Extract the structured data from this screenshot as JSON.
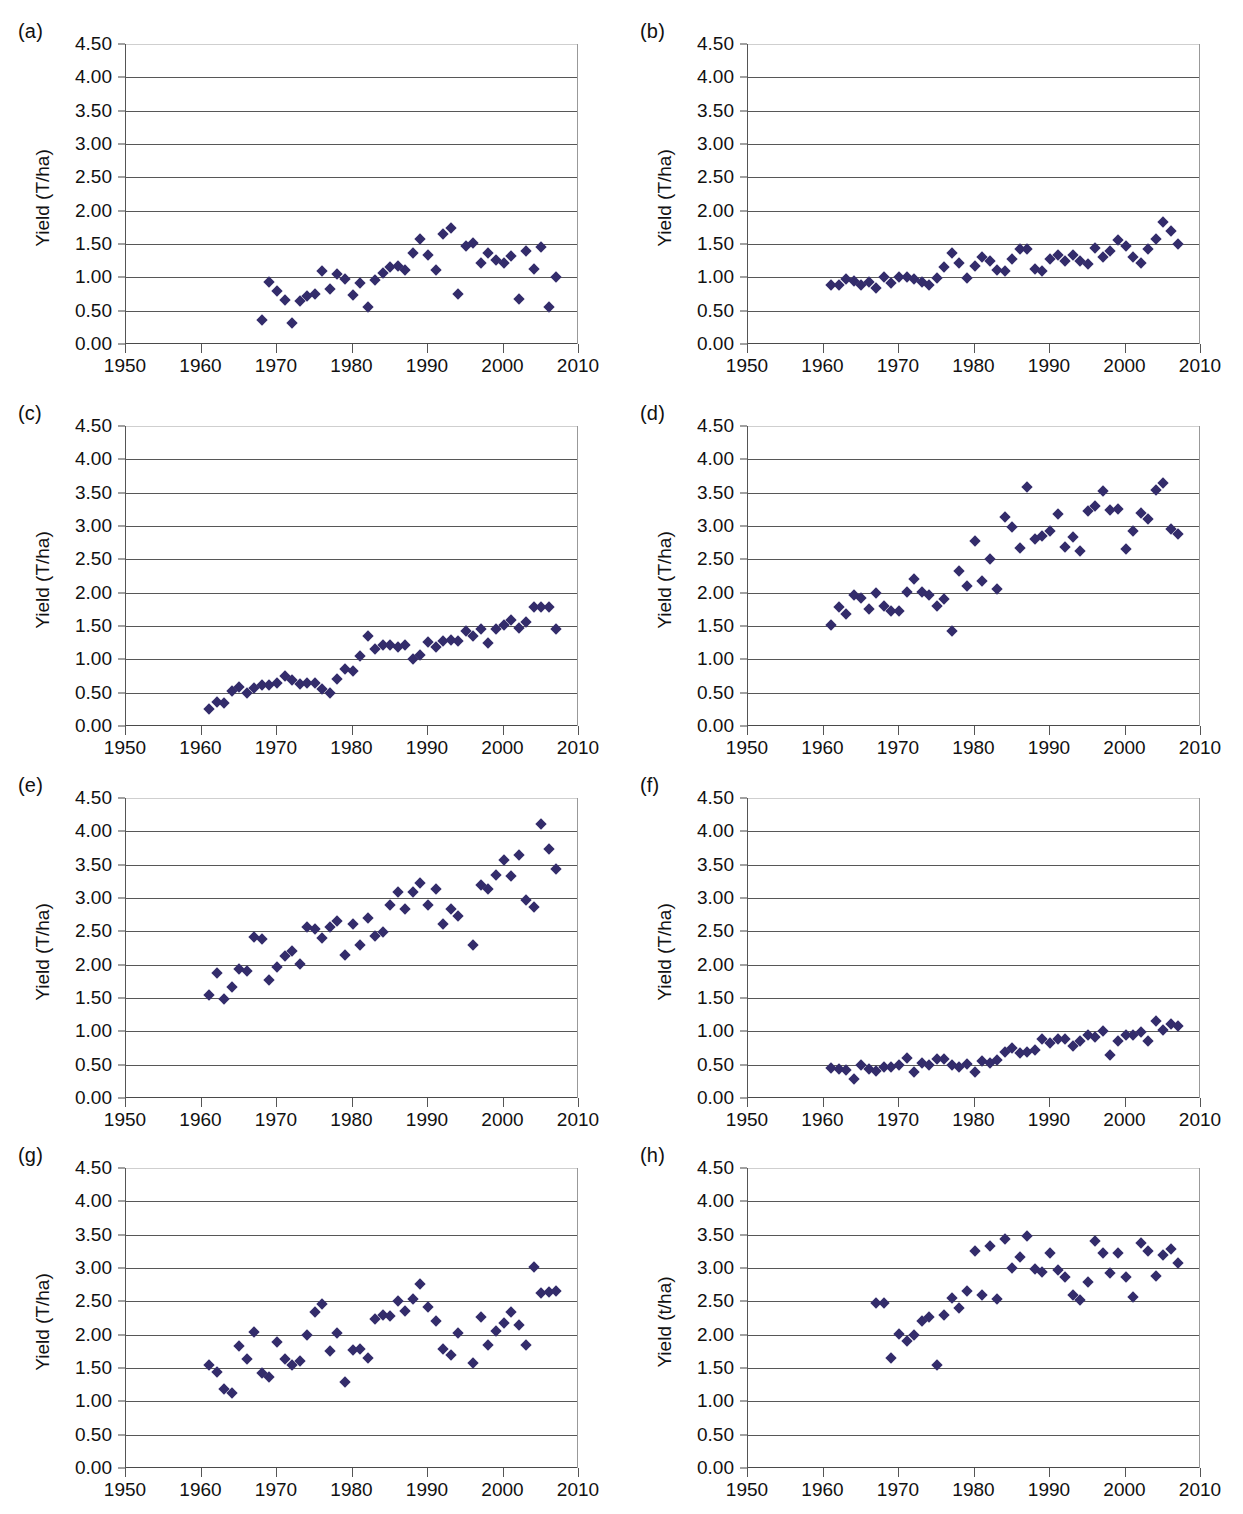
{
  "figure": {
    "panel_label_a": "(a)",
    "panel_label_b": "(b)",
    "panel_label_c": "(c)",
    "panel_label_d": "(d)",
    "panel_label_e": "(e)",
    "panel_label_f": "(f)",
    "panel_label_g": "(g)",
    "panel_label_h": "(h)",
    "marker_color": "#332c6b",
    "grid_color": "#575757",
    "caption": ""
  },
  "axis": {
    "ytick_labels": [
      "0.00",
      "0.50",
      "1.00",
      "1.50",
      "2.00",
      "2.50",
      "3.00",
      "3.50",
      "4.00",
      "4.50"
    ],
    "xtick_labels": [
      "1950",
      "1960",
      "1970",
      "1980",
      "1990",
      "2000",
      "2010"
    ],
    "ylabel_upper": "Yield (T/ha)",
    "ylabel_lower": "Yield (t/ha)"
  },
  "chart_data": [
    {
      "type": "scatter",
      "panel": "(a)",
      "title": "",
      "xlabel": "",
      "ylabel": "Yield (T/ha)",
      "xlim": [
        1950,
        2010
      ],
      "ylim": [
        0.0,
        4.5
      ],
      "grid": true,
      "legend": "none",
      "x": [
        1968,
        1969,
        1970,
        1971,
        1972,
        1973,
        1974,
        1975,
        1976,
        1977,
        1978,
        1979,
        1980,
        1981,
        1982,
        1983,
        1984,
        1985,
        1986,
        1987,
        1988,
        1989,
        1990,
        1991,
        1992,
        1993,
        1994,
        1995,
        1996,
        1997,
        1998,
        1999,
        2000,
        2001,
        2002,
        2003,
        2004,
        2005,
        2006,
        2007
      ],
      "y": [
        0.36,
        0.93,
        0.79,
        0.66,
        0.32,
        0.64,
        0.72,
        0.75,
        1.09,
        0.83,
        1.05,
        0.97,
        0.73,
        0.92,
        0.55,
        0.96,
        1.07,
        1.15,
        1.17,
        1.11,
        1.36,
        1.57,
        1.34,
        1.11,
        1.65,
        1.74,
        0.75,
        1.47,
        1.51,
        1.21,
        1.36,
        1.26,
        1.21,
        1.32,
        0.67,
        1.4,
        1.12,
        1.46,
        0.55,
        1.0
      ]
    },
    {
      "type": "scatter",
      "panel": "(b)",
      "title": "",
      "xlabel": "",
      "ylabel": "Yield (T/ha)",
      "xlim": [
        1950,
        2010
      ],
      "ylim": [
        0.0,
        4.5
      ],
      "grid": true,
      "legend": "none",
      "x": [
        1961,
        1962,
        1963,
        1964,
        1965,
        1966,
        1967,
        1968,
        1969,
        1970,
        1971,
        1972,
        1973,
        1974,
        1975,
        1976,
        1977,
        1978,
        1979,
        1980,
        1981,
        1982,
        1983,
        1984,
        1985,
        1986,
        1987,
        1988,
        1989,
        1990,
        1991,
        1992,
        1993,
        1994,
        1995,
        1996,
        1997,
        1998,
        1999,
        2000,
        2001,
        2002,
        2003,
        2004,
        2005,
        2006,
        2007
      ],
      "y": [
        0.88,
        0.88,
        0.98,
        0.94,
        0.88,
        0.93,
        0.84,
        1.01,
        0.92,
        1.0,
        1.01,
        0.97,
        0.93,
        0.89,
        0.99,
        1.15,
        1.36,
        1.22,
        0.99,
        1.17,
        1.31,
        1.24,
        1.11,
        1.09,
        1.27,
        1.43,
        1.43,
        1.13,
        1.09,
        1.27,
        1.33,
        1.24,
        1.34,
        1.24,
        1.2,
        1.44,
        1.31,
        1.39,
        1.56,
        1.47,
        1.31,
        1.22,
        1.42,
        1.57,
        1.83,
        1.7,
        1.5
      ]
    },
    {
      "type": "scatter",
      "panel": "(c)",
      "title": "",
      "xlabel": "",
      "ylabel": "Yield (T/ha)",
      "xlim": [
        1950,
        2010
      ],
      "ylim": [
        0.0,
        4.5
      ],
      "grid": true,
      "legend": "none",
      "x": [
        1961,
        1962,
        1963,
        1964,
        1965,
        1966,
        1967,
        1968,
        1969,
        1970,
        1971,
        1972,
        1973,
        1974,
        1975,
        1976,
        1977,
        1978,
        1979,
        1980,
        1981,
        1982,
        1983,
        1984,
        1985,
        1986,
        1987,
        1988,
        1989,
        1990,
        1991,
        1992,
        1993,
        1994,
        1995,
        1996,
        1997,
        1998,
        1999,
        2000,
        2001,
        2002,
        2003,
        2004,
        2005,
        2006,
        2007
      ],
      "y": [
        0.26,
        0.36,
        0.35,
        0.53,
        0.59,
        0.5,
        0.57,
        0.62,
        0.61,
        0.65,
        0.75,
        0.69,
        0.63,
        0.65,
        0.65,
        0.56,
        0.5,
        0.71,
        0.86,
        0.83,
        1.05,
        1.35,
        1.15,
        1.22,
        1.22,
        1.18,
        1.22,
        1.01,
        1.06,
        1.26,
        1.19,
        1.27,
        1.29,
        1.27,
        1.42,
        1.35,
        1.45,
        1.25,
        1.45,
        1.51,
        1.59,
        1.47,
        1.56,
        1.78,
        1.78,
        1.79,
        1.46
      ]
    },
    {
      "type": "scatter",
      "panel": "(d)",
      "title": "",
      "xlabel": "",
      "ylabel": "Yield (T/ha)",
      "xlim": [
        1950,
        2010
      ],
      "ylim": [
        0.0,
        4.5
      ],
      "grid": true,
      "legend": "none",
      "x": [
        1961,
        1962,
        1963,
        1964,
        1965,
        1966,
        1967,
        1968,
        1969,
        1970,
        1971,
        1972,
        1973,
        1974,
        1975,
        1976,
        1977,
        1978,
        1979,
        1980,
        1981,
        1982,
        1983,
        1984,
        1985,
        1986,
        1987,
        1988,
        1989,
        1990,
        1991,
        1992,
        1993,
        1994,
        1995,
        1996,
        1997,
        1998,
        1999,
        2000,
        2001,
        2002,
        2003,
        2004,
        2005,
        2006,
        2007
      ],
      "y": [
        1.51,
        1.78,
        1.68,
        1.97,
        1.92,
        1.76,
        1.99,
        1.8,
        1.73,
        1.73,
        2.01,
        2.2,
        2.01,
        1.96,
        1.8,
        1.91,
        1.43,
        2.32,
        2.1,
        2.78,
        2.18,
        2.51,
        2.05,
        3.13,
        2.99,
        2.67,
        3.58,
        2.8,
        2.85,
        2.92,
        3.18,
        2.69,
        2.83,
        2.63,
        3.22,
        3.3,
        3.53,
        3.24,
        3.26,
        2.65,
        2.93,
        3.19,
        3.11,
        3.54,
        3.64,
        2.95,
        2.88
      ]
    },
    {
      "type": "scatter",
      "panel": "(e)",
      "title": "",
      "xlabel": "",
      "ylabel": "Yield (T/ha)",
      "xlim": [
        1950,
        2010
      ],
      "ylim": [
        0.0,
        4.5
      ],
      "grid": true,
      "legend": "none",
      "x": [
        1961,
        1962,
        1963,
        1964,
        1965,
        1966,
        1967,
        1968,
        1969,
        1970,
        1971,
        1972,
        1973,
        1974,
        1975,
        1976,
        1977,
        1978,
        1979,
        1980,
        1981,
        1982,
        1983,
        1984,
        1985,
        1986,
        1987,
        1988,
        1989,
        1990,
        1991,
        1992,
        1993,
        1994,
        1996,
        1997,
        1998,
        1999,
        2000,
        2001,
        2002,
        2003,
        2004,
        2005,
        2006,
        2007
      ],
      "y": [
        1.54,
        1.88,
        1.48,
        1.67,
        1.94,
        1.91,
        2.41,
        2.39,
        1.77,
        1.97,
        2.13,
        2.21,
        2.01,
        2.57,
        2.53,
        2.4,
        2.56,
        2.65,
        2.15,
        2.61,
        2.3,
        2.7,
        2.43,
        2.49,
        2.89,
        3.09,
        2.83,
        3.09,
        3.23,
        2.89,
        3.13,
        2.61,
        2.83,
        2.73,
        2.3,
        3.19,
        3.13,
        3.35,
        3.57,
        3.33,
        3.65,
        2.97,
        2.87,
        4.11,
        3.73,
        3.43
      ]
    },
    {
      "type": "scatter",
      "panel": "(f)",
      "title": "",
      "xlabel": "",
      "ylabel": "Yield (T/ha)",
      "xlim": [
        1950,
        2010
      ],
      "ylim": [
        0.0,
        4.5
      ],
      "grid": true,
      "legend": "none",
      "x": [
        1961,
        1962,
        1963,
        1964,
        1965,
        1966,
        1967,
        1968,
        1969,
        1970,
        1971,
        1972,
        1973,
        1974,
        1975,
        1976,
        1977,
        1978,
        1979,
        1980,
        1981,
        1982,
        1983,
        1984,
        1985,
        1986,
        1987,
        1988,
        1989,
        1990,
        1991,
        1992,
        1993,
        1994,
        1995,
        1996,
        1997,
        1998,
        1999,
        2000,
        2001,
        2002,
        2003,
        2004,
        2005,
        2006,
        2007
      ],
      "y": [
        0.45,
        0.43,
        0.42,
        0.29,
        0.49,
        0.44,
        0.4,
        0.46,
        0.47,
        0.49,
        0.6,
        0.39,
        0.52,
        0.5,
        0.59,
        0.58,
        0.49,
        0.47,
        0.51,
        0.39,
        0.55,
        0.52,
        0.57,
        0.69,
        0.75,
        0.67,
        0.69,
        0.72,
        0.89,
        0.82,
        0.89,
        0.89,
        0.78,
        0.85,
        0.94,
        0.91,
        1.01,
        0.65,
        0.85,
        0.95,
        0.94,
        0.99,
        0.85,
        1.15,
        1.02,
        1.11,
        1.08
      ]
    },
    {
      "type": "scatter",
      "panel": "(g)",
      "title": "",
      "xlabel": "",
      "ylabel": "Yield (T/ha)",
      "xlim": [
        1950,
        2010
      ],
      "ylim": [
        0.0,
        4.5
      ],
      "grid": true,
      "legend": "none",
      "x": [
        1961,
        1962,
        1963,
        1964,
        1965,
        1966,
        1967,
        1968,
        1969,
        1970,
        1971,
        1972,
        1973,
        1974,
        1975,
        1976,
        1977,
        1978,
        1979,
        1980,
        1981,
        1982,
        1983,
        1984,
        1985,
        1986,
        1987,
        1988,
        1989,
        1990,
        1991,
        1992,
        1993,
        1994,
        1996,
        1997,
        1998,
        1999,
        2000,
        2001,
        2002,
        2003,
        2004,
        2005,
        2006,
        2007
      ],
      "y": [
        1.54,
        1.44,
        1.18,
        1.12,
        1.83,
        1.63,
        2.04,
        1.42,
        1.36,
        1.89,
        1.63,
        1.54,
        1.61,
        2.0,
        2.34,
        2.46,
        1.75,
        2.03,
        1.29,
        1.77,
        1.78,
        1.65,
        2.23,
        2.29,
        2.28,
        2.51,
        2.36,
        2.53,
        2.76,
        2.41,
        2.21,
        1.79,
        1.69,
        2.02,
        1.57,
        2.26,
        1.85,
        2.05,
        2.17,
        2.34,
        2.15,
        1.85,
        3.02,
        2.62,
        2.64,
        2.65
      ]
    },
    {
      "type": "scatter",
      "panel": "(h)",
      "title": "",
      "xlabel": "",
      "ylabel": "Yield (t/ha)",
      "xlim": [
        1950,
        2010
      ],
      "ylim": [
        0.0,
        4.5
      ],
      "grid": true,
      "legend": "none",
      "x": [
        1967,
        1968,
        1969,
        1970,
        1971,
        1972,
        1973,
        1974,
        1975,
        1976,
        1977,
        1978,
        1979,
        1980,
        1981,
        1982,
        1983,
        1984,
        1985,
        1986,
        1987,
        1988,
        1989,
        1990,
        1991,
        1992,
        1993,
        1994,
        1995,
        1996,
        1997,
        1998,
        1999,
        2000,
        2001,
        2002,
        2003,
        2004,
        2005,
        2006,
        2007
      ],
      "y": [
        2.48,
        2.48,
        1.65,
        2.01,
        1.91,
        2.0,
        2.2,
        2.26,
        1.55,
        2.3,
        2.55,
        2.4,
        2.66,
        3.26,
        2.59,
        3.33,
        2.54,
        3.43,
        3.0,
        3.16,
        3.48,
        2.98,
        2.94,
        3.22,
        2.97,
        2.86,
        2.59,
        2.52,
        2.79,
        3.41,
        3.22,
        2.92,
        3.22,
        2.87,
        2.56,
        3.38,
        3.25,
        2.88,
        3.19,
        3.28,
        3.08
      ]
    }
  ]
}
